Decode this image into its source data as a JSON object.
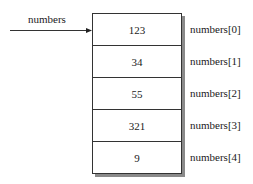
{
  "diagram": {
    "pointer_label": "numbers",
    "cells": [
      {
        "value": "123",
        "index_label": "numbers[0]"
      },
      {
        "value": "34",
        "index_label": "numbers[1]"
      },
      {
        "value": "55",
        "index_label": "numbers[2]"
      },
      {
        "value": "321",
        "index_label": "numbers[3]"
      },
      {
        "value": "9",
        "index_label": "numbers[4]"
      }
    ]
  }
}
